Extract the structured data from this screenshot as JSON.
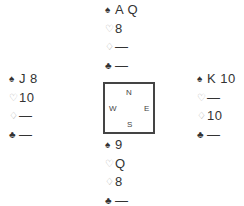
{
  "suits": {
    "spades": {
      "symbol": "♠",
      "style": "filled"
    },
    "hearts": {
      "symbol": "♡",
      "style": "hollow"
    },
    "diamonds": {
      "symbol": "♢",
      "style": "hollow"
    },
    "clubs": {
      "symbol": "♣",
      "style": "filled"
    }
  },
  "hands": {
    "north": {
      "spades": "A Q",
      "hearts": "8",
      "diamonds": "—",
      "clubs": "—"
    },
    "west": {
      "spades": "J 8",
      "hearts": "10",
      "diamonds": "—",
      "clubs": "—"
    },
    "east": {
      "spades": "K 10",
      "hearts": "—",
      "diamonds": "10",
      "clubs": "—"
    },
    "south": {
      "spades": "9",
      "hearts": "Q",
      "diamonds": "8",
      "clubs": "—"
    }
  },
  "compass": {
    "north": "N",
    "south": "S",
    "west": "W",
    "east": "E"
  }
}
